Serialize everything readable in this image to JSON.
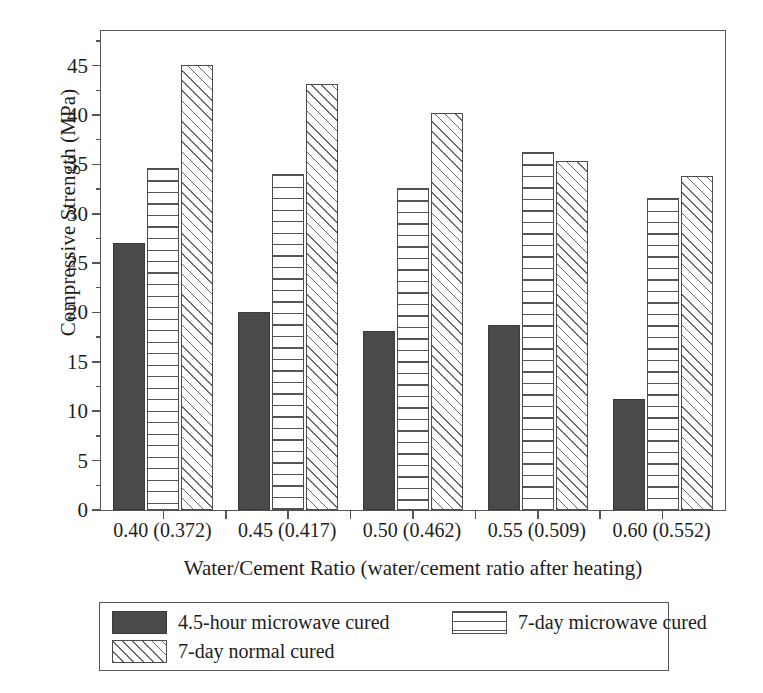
{
  "chart_data": {
    "type": "bar",
    "title": "",
    "xlabel": "Water/Cement Ratio (water/cement ratio after heating)",
    "ylabel": "Compressive Strength (MPa)",
    "categories": [
      "0.40 (0.372)",
      "0.45 (0.417)",
      "0.50 (0.462)",
      "0.55 (0.509)",
      "0.60 (0.552)"
    ],
    "series": [
      {
        "name": "4.5-hour microwave cured",
        "pattern": "solid-dark",
        "values": [
          27.0,
          20.1,
          18.1,
          18.7,
          11.2
        ]
      },
      {
        "name": "7-day microwave cured",
        "pattern": "horizontal-lines",
        "values": [
          34.6,
          34.0,
          32.6,
          36.2,
          31.6
        ]
      },
      {
        "name": "7-day normal cured",
        "pattern": "diagonal-hatch",
        "values": [
          45.1,
          43.1,
          40.2,
          35.3,
          33.8
        ]
      }
    ],
    "ylim": [
      0,
      48.5
    ],
    "ytick_values": [
      0,
      5,
      10,
      15,
      20,
      25,
      30,
      35,
      40,
      45
    ],
    "ytick_labels": [
      "0",
      "5",
      "10",
      "15",
      "20",
      "25",
      "30",
      "35",
      "40",
      "45"
    ],
    "yminor_values": [
      2.5,
      7.5,
      12.5,
      17.5,
      22.5,
      27.5,
      32.5,
      37.5,
      42.5,
      47.5
    ],
    "grid": false,
    "legend_position": "below-axes",
    "colors": {
      "solid-dark": "#4a4a4a",
      "line": "#555555",
      "background": "#ffffff"
    }
  }
}
